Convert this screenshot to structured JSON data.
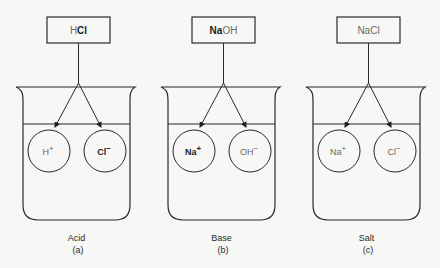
{
  "panels": [
    {
      "id": "a",
      "compound": [
        {
          "text": "H",
          "style": "light"
        },
        {
          "text": "Cl",
          "style": "bold"
        }
      ],
      "ions": [
        {
          "symbol": "H",
          "charge": "+",
          "style": "light"
        },
        {
          "symbol": "Cl",
          "charge": "−",
          "style": "bold"
        }
      ],
      "caption": "Acid",
      "letter": "(a)"
    },
    {
      "id": "b",
      "compound": [
        {
          "text": "Na",
          "style": "bold"
        },
        {
          "text": "OH",
          "style": "light"
        }
      ],
      "ions": [
        {
          "symbol": "Na",
          "charge": "+",
          "style": "bold"
        },
        {
          "symbol": "OH",
          "charge": "−",
          "style": "light"
        }
      ],
      "caption": "Base",
      "letter": "(b)"
    },
    {
      "id": "c",
      "compound": [
        {
          "text": "NaCl",
          "style": "light"
        }
      ],
      "ions": [
        {
          "symbol": "Na",
          "charge": "+",
          "style": "light"
        },
        {
          "symbol": "Cl",
          "charge": "−",
          "style": "light"
        }
      ],
      "caption": "Salt",
      "letter": "(c)"
    }
  ]
}
